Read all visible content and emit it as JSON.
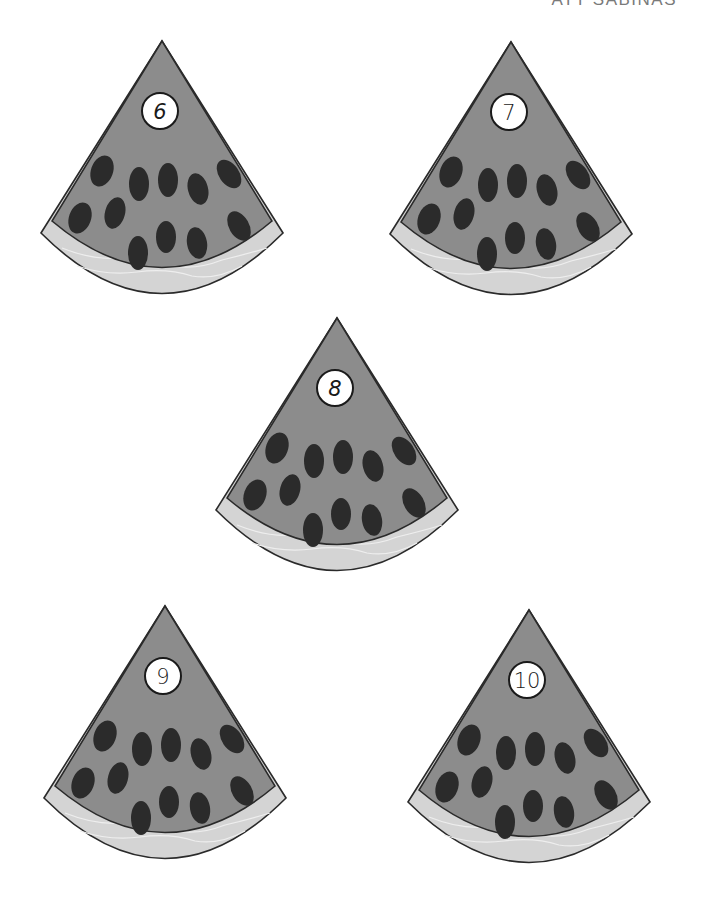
{
  "page": {
    "header_text": "ATT SABINAS",
    "colors": {
      "background": "#ffffff",
      "flesh": "#8c8c8c",
      "rind": "#d4d4d4",
      "rind_texture": "#eeeeee",
      "seed": "#2b2b2b",
      "outline": "#2a2a2a",
      "number_circle": "#ffffff"
    }
  },
  "slices": [
    {
      "id": "slice-6",
      "number": "6",
      "left": 32,
      "top": 34
    },
    {
      "id": "slice-7",
      "number": "7",
      "left": 381,
      "top": 35
    },
    {
      "id": "slice-8",
      "number": "8",
      "left": 207,
      "top": 311
    },
    {
      "id": "slice-9",
      "number": "9",
      "left": 35,
      "top": 599
    },
    {
      "id": "slice-10",
      "number": "10",
      "left": 399,
      "top": 603
    }
  ]
}
